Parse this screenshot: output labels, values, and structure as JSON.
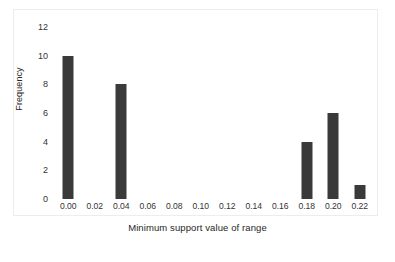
{
  "chart_data": {
    "type": "bar",
    "title": "",
    "subtitle": "",
    "xlabel": "Minimum support value of range",
    "ylabel": "Frequency",
    "categories": [
      "0.00",
      "0.02",
      "0.04",
      "0.06",
      "0.08",
      "0.10",
      "0.12",
      "0.14",
      "0.16",
      "0.18",
      "0.20",
      "0.22"
    ],
    "values": [
      10,
      0,
      8,
      0,
      0,
      0,
      0,
      0,
      0,
      4,
      6,
      1
    ],
    "ylim": [
      0,
      12
    ],
    "yticks": [
      12,
      10,
      8,
      6,
      4,
      2,
      0
    ],
    "xticks": [
      "0.00",
      "0.02",
      "0.04",
      "0.06",
      "0.08",
      "0.10",
      "0.12",
      "0.14",
      "0.16",
      "0.18",
      "0.20",
      "0.22"
    ],
    "grid": false,
    "legend": false,
    "legend_position": "none",
    "bar_color": "#3a3a3a",
    "background_color": "#ffffff",
    "frame_color": "#ededed",
    "annotations": []
  }
}
